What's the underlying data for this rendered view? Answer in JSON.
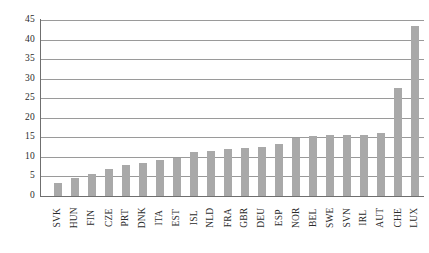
{
  "chart_data": {
    "type": "bar",
    "title": "",
    "xlabel": "",
    "ylabel": "",
    "ylim": [
      0,
      45
    ],
    "ytick_step": 5,
    "yticks": [
      0,
      5,
      10,
      15,
      20,
      25,
      30,
      35,
      40,
      45
    ],
    "grid": true,
    "legend": false,
    "bar_color": "#a9a9a9",
    "axis_color": "#6f6f6f",
    "gridline_color": "#9a9a9a",
    "text_color": "#2b2b2b",
    "categories": [
      "SVK",
      "HUN",
      "FIN",
      "CZE",
      "PRT",
      "DNK",
      "ITA",
      "EST",
      "ISL",
      "NLD",
      "FRA",
      "GBR",
      "DEU",
      "ESP",
      "NOR",
      "BEL",
      "SWE",
      "SVN",
      "IRL",
      "AUT",
      "CHE",
      "LUX"
    ],
    "values": [
      3.4,
      4.6,
      5.6,
      7.0,
      8.0,
      8.5,
      9.3,
      9.7,
      11.3,
      11.5,
      12.0,
      12.3,
      12.6,
      13.3,
      14.8,
      15.4,
      15.6,
      15.6,
      15.7,
      16.0,
      27.6,
      43.5
    ],
    "series": [
      {
        "name": "",
        "values": [
          3.4,
          4.6,
          5.6,
          7.0,
          8.0,
          8.5,
          9.3,
          9.7,
          11.3,
          11.5,
          12.0,
          12.3,
          12.6,
          13.3,
          14.8,
          15.4,
          15.6,
          15.6,
          15.7,
          16.0,
          27.6,
          43.5
        ]
      }
    ]
  }
}
